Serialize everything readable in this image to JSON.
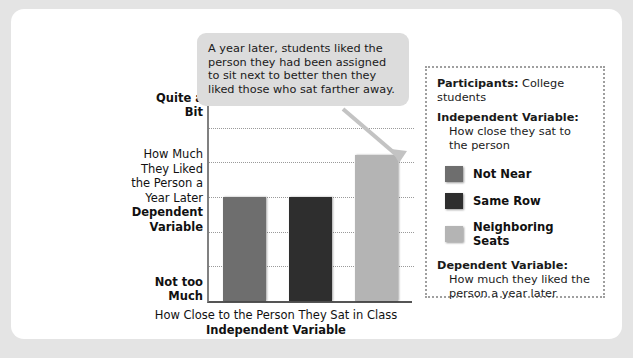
{
  "chart_data": {
    "type": "bar",
    "title": "",
    "categories": [
      "Not Near",
      "Same Row",
      "Neighboring Seats"
    ],
    "values": [
      3,
      3,
      4.2
    ],
    "ylim": [
      0,
      6
    ],
    "gridlines": 5,
    "grid": true,
    "xlabel_line1": "How Close to the Person They Sat in Class",
    "xlabel_line2": "Independent Variable",
    "ylabel_line1": "How Much",
    "ylabel_line2": "They Liked",
    "ylabel_line3": "the Person a",
    "ylabel_line4": "Year Later",
    "ylabel_strong": "Dependent Variable",
    "ytick_top_line1": "Quite a",
    "ytick_top_line2": "Bit",
    "ytick_bottom_line1": "Not too",
    "ytick_bottom_line2": "Much",
    "series": [
      {
        "name": "Not Near",
        "value": 3,
        "color": "#6e6e6e"
      },
      {
        "name": "Same Row",
        "value": 3,
        "color": "#2e2e2e"
      },
      {
        "name": "Neighboring Seats",
        "value": 4.2,
        "color": "#b4b4b4"
      }
    ],
    "legend_position": "right"
  },
  "callout": {
    "text": "A year later, students liked the person they had been assigned to sit next to better then they liked those who sat farther away."
  },
  "legend": {
    "participants_label": "Participants:",
    "participants_value": "College students",
    "independent_label": "Independent Variable:",
    "independent_value": "How close they sat to the person",
    "dependent_label": "Dependent Variable:",
    "dependent_value": "How much they liked the person a year later",
    "items": [
      {
        "label": "Not Near",
        "color": "#6e6e6e"
      },
      {
        "label": "Same Row",
        "color": "#2e2e2e"
      },
      {
        "label": "Neighboring Seats",
        "color": "#b4b4b4"
      }
    ]
  },
  "colors": {
    "page_background": "#e4e4e4",
    "card_background": "#ffffff",
    "callout_background": "#dcdcdc",
    "grid": "#9a9a9a",
    "axis": "#555555",
    "legend_border": "#9f9f9f"
  }
}
